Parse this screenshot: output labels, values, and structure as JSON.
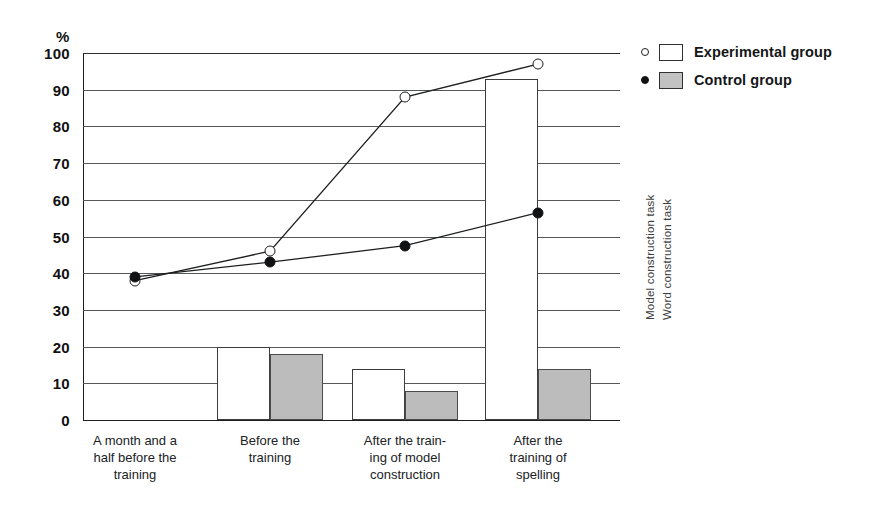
{
  "chart": {
    "y_unit": "%",
    "y_ticks": [
      100,
      90,
      80,
      70,
      60,
      50,
      40,
      30,
      20,
      10,
      0
    ],
    "side_labels": [
      "Model construction task",
      "Word construction task"
    ],
    "legend": [
      {
        "marker": "open-circle",
        "swatch": "white",
        "label": "Experimental group"
      },
      {
        "marker": "filled-circle",
        "swatch": "gray",
        "label": "Control group"
      }
    ],
    "categories": [
      [
        "A month  and a",
        "half  before the",
        "training"
      ],
      [
        "Before the",
        "training"
      ],
      [
        "After the train-",
        "ing of model",
        "construction"
      ],
      [
        "After the",
        "training of",
        "spelling"
      ]
    ]
  },
  "chart_data": {
    "type": "bar",
    "title": "",
    "xlabel": "",
    "ylabel": "%",
    "ylim": [
      0,
      100
    ],
    "y_ticks": [
      0,
      10,
      20,
      30,
      40,
      50,
      60,
      70,
      80,
      90,
      100
    ],
    "grid": true,
    "legend_position": "right",
    "categories": [
      "A month and a half before the training",
      "Before the training",
      "After the training of model construction",
      "After the training of spelling"
    ],
    "series": [
      {
        "name": "Experimental group",
        "render": "bar",
        "task": "Word construction task",
        "marker": "white-bar",
        "values": [
          null,
          20,
          14,
          93
        ]
      },
      {
        "name": "Control group",
        "render": "bar",
        "task": "Word construction task",
        "marker": "gray-bar",
        "values": [
          null,
          18,
          8,
          14
        ]
      },
      {
        "name": "Experimental group",
        "render": "line",
        "task": "Model construction task",
        "marker": "open-circle",
        "values": [
          38,
          46,
          88,
          97
        ]
      },
      {
        "name": "Control group",
        "render": "line",
        "task": "Model construction task",
        "marker": "filled-circle",
        "values": [
          39,
          43,
          47.5,
          56.5
        ]
      }
    ]
  }
}
